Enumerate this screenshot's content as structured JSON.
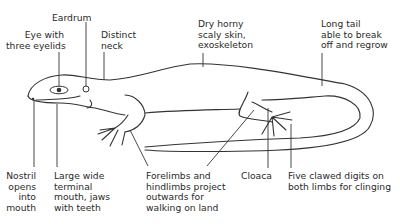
{
  "diagram": {
    "labels": {
      "eardrum": "Eardrum",
      "eye": "Eye with\nthree eyelids",
      "neck": "Distinct\nneck",
      "skin": "Dry horny\nscaly skin,\nexoskeleton",
      "tail": "Long tail\nable to break\noff and regrow",
      "nostril": "Nostril\nopens\ninto\nmouth",
      "mouth": "Large wide\nterminal\nmouth, jaws\nwith teeth",
      "limbs": "Forelimbs and\nhindlimbs project\noutwards for\nwalking on land",
      "cloaca": "Cloaca",
      "digits": "Five clawed digits on\nboth limbs for clinging"
    }
  }
}
